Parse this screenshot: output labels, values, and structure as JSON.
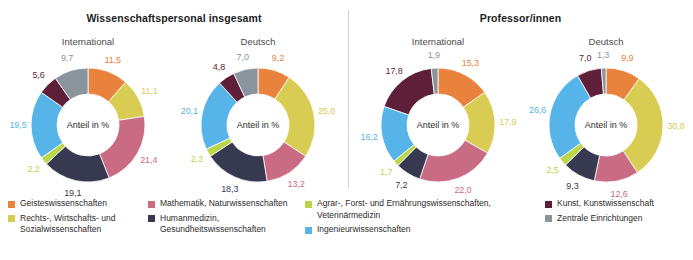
{
  "chart_data": {
    "type": "pie",
    "title": "",
    "center_label": "Anteil in %",
    "categories": [
      "Geisteswissenschaften",
      "Rechts-, Wirtschafts- und Sozialwissenschaften",
      "Mathematik, Naturwissenschaften",
      "Humanmedizin, Gesundheitswissenschaften",
      "Agrar-, Forst- und Ernährungswissenschaften, Veterinärmedizin",
      "Ingenieurwissenschaften",
      "Kunst, Kunstwissenschaft",
      "Zentrale Einrichtungen"
    ],
    "colors": [
      "#E8823C",
      "#D9CC52",
      "#C96B83",
      "#36394F",
      "#BBD64A",
      "#56B4E8",
      "#5E1F38",
      "#8A949C"
    ],
    "panels": [
      {
        "title": "Wissenschaftspersonal insgesamt",
        "charts": [
          {
            "subtitle": "International",
            "values": [
              11.5,
              11.1,
              21.4,
              19.1,
              2.2,
              19.5,
              5.6,
              9.7
            ],
            "labels": [
              "11,5",
              "11,1",
              "21,4",
              "19,1",
              "2,2",
              "19,5",
              "5,6",
              "9,7"
            ]
          },
          {
            "subtitle": "Deutsch",
            "values": [
              9.2,
              25.0,
              13.2,
              18.3,
              2.3,
              20.1,
              4.8,
              7.0
            ],
            "labels": [
              "9,2",
              "25,0",
              "13,2",
              "18,3",
              "2,3",
              "20,1",
              "4,8",
              "7,0"
            ]
          }
        ]
      },
      {
        "title": "Professor/innen",
        "charts": [
          {
            "subtitle": "International",
            "values": [
              15.3,
              17.9,
              22.0,
              7.2,
              1.7,
              16.2,
              17.8,
              1.9
            ],
            "labels": [
              "15,3",
              "17,9",
              "22,0",
              "7,2",
              "1,7",
              "16,2",
              "17,8",
              "1,9"
            ]
          },
          {
            "subtitle": "Deutsch",
            "values": [
              9.9,
              30.8,
              12.6,
              9.3,
              2.5,
              26.6,
              7.0,
              1.3
            ],
            "labels": [
              "9,9",
              "30,8",
              "12,6",
              "9,3",
              "2,5",
              "26,6",
              "7,0",
              "1,3"
            ]
          }
        ]
      }
    ],
    "legend_columns": [
      {
        "items": [
          0,
          1
        ]
      },
      {
        "items": [
          2,
          3
        ]
      },
      {
        "items": [
          4,
          5
        ]
      },
      {
        "items": [
          6,
          7
        ]
      }
    ]
  }
}
